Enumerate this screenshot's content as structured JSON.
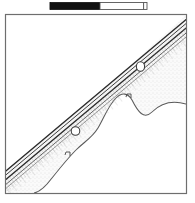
{
  "figure": {
    "kind": "archaeological-plan-line-drawing",
    "title": "",
    "background_color": "#ffffff",
    "ink_color": "#3a3a3a",
    "frame": {
      "name": "drawing-frame",
      "x": 5.5,
      "y": 14.5,
      "width": 181,
      "height": 179,
      "stroke": "#6e6e6e",
      "stroke_width": 1.1,
      "fill": "#ffffff"
    },
    "scalebar": {
      "name": "scale-bar",
      "x": 50,
      "y": 2.5,
      "total_width": 97,
      "height": 7,
      "segments": [
        {
          "label": "",
          "fill": "#111111",
          "stroke": "#111111",
          "width": 50
        },
        {
          "label": "",
          "fill": "#ffffff",
          "stroke": "#555555",
          "width": 47
        }
      ],
      "end_tick_color": "#555555"
    },
    "band": {
      "name": "diagonal-band-feature",
      "description": "linear band running upper-right to lower-left",
      "line_color_dark": "#2e2e2e",
      "line_color_mid": "#6a6a6a",
      "fill_color": "#f2f2f2",
      "entry_point": "top-right",
      "exit_point": "bottom-left"
    },
    "deposit": {
      "name": "stippled-deposit-area",
      "description": "wavy-edged shaded deposit below and right of the band",
      "fill_color": "#fafafa",
      "edge_color": "#5a5a5a",
      "hatch_color": "#9a9a9a"
    },
    "stones": [
      {
        "name": "stone-circle-upper",
        "cx": 140.5,
        "cy": 66.5,
        "rx": 4.1,
        "ry": 4.8
      },
      {
        "name": "stone-circle-lower",
        "cx": 75.5,
        "cy": 131.0,
        "rx": 4.3,
        "ry": 4.3
      }
    ],
    "notches": [
      {
        "name": "outline-notch-upper",
        "x": 128,
        "y": 96
      },
      {
        "name": "outline-notch-lower",
        "x": 68,
        "y": 155
      }
    ]
  }
}
